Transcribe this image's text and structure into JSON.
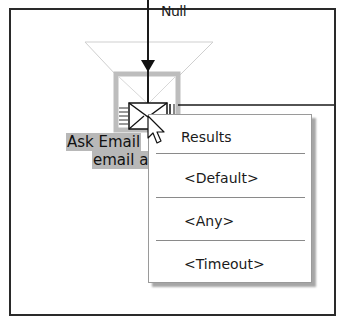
{
  "diagram": {
    "incoming_label": "Null",
    "node": {
      "icon": "envelope-icon",
      "label_line1": "Ask Email",
      "label_line2": "email a"
    }
  },
  "context_menu": {
    "title": "Results",
    "items": [
      {
        "label": "<Default>"
      },
      {
        "label": "<Any>"
      },
      {
        "label": "<Timeout>"
      }
    ]
  },
  "colors": {
    "frame_border": "#2a2a2a",
    "node_border": "#bdbdbd",
    "label_highlight": "#b8b8b8",
    "menu_border": "#9a9a9a",
    "separator": "#8a8a8a"
  }
}
